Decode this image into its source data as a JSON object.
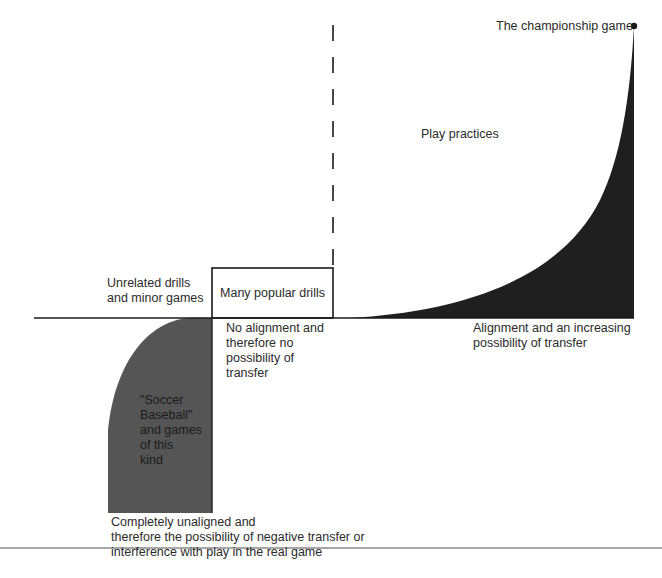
{
  "diagram": {
    "labels": {
      "championship": "The championship game",
      "play_practices": "Play practices",
      "unrelated": "Unrelated drills\nand minor games",
      "popular_drills": "Many popular drills",
      "no_alignment": "No alignment and\ntherefore no\npossibility of\ntransfer",
      "alignment": "Alignment and an increasing\npossibility of transfer",
      "soccer_baseball": "\"Soccer\nBaseball\"\nand games\nof this\nkind",
      "unaligned": "Completely unaligned and\ntherefore the possibility of negative transfer or\ninterference with play in the real game"
    },
    "colors": {
      "positive_region": "#1f1f1f",
      "negative_region": "#555555",
      "axis": "#1a1a1a",
      "bottom_rule": "#8a8a8a"
    }
  }
}
